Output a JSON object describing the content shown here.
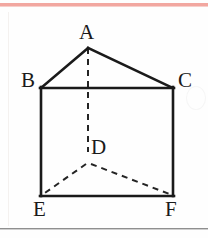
{
  "figure": {
    "kind": "geometry-diagram",
    "colors": {
      "stroke": "#1a1a1a",
      "hidden_stroke": "#242424",
      "background": "#fefefe",
      "top_rule": "#f2a7a0",
      "bottom_rule": "#8f8f8f"
    },
    "labels": [
      {
        "id": "A",
        "text": "A",
        "x": 88,
        "y": 48
      },
      {
        "id": "B",
        "text": "B",
        "x": 41,
        "y": 88
      },
      {
        "id": "C",
        "text": "C",
        "x": 173,
        "y": 88
      },
      {
        "id": "D",
        "text": "D",
        "x": 88,
        "y": 158
      },
      {
        "id": "E",
        "text": "E",
        "x": 41,
        "y": 196
      },
      {
        "id": "F",
        "text": "F",
        "x": 173,
        "y": 196
      }
    ],
    "solid_edges": [
      {
        "from": "B",
        "to": "A"
      },
      {
        "from": "A",
        "to": "C"
      },
      {
        "from": "B",
        "to": "C"
      },
      {
        "from": "B",
        "to": "E"
      },
      {
        "from": "C",
        "to": "F"
      },
      {
        "from": "E",
        "to": "F"
      }
    ],
    "dashed_edges": [
      {
        "from": "A",
        "to": "D"
      },
      {
        "from": "D",
        "to": "E"
      },
      {
        "from": "D",
        "to": "F"
      }
    ],
    "rules": {
      "top_rule_label": "top page rule",
      "bottom_rule_label": "bottom page rule"
    }
  }
}
